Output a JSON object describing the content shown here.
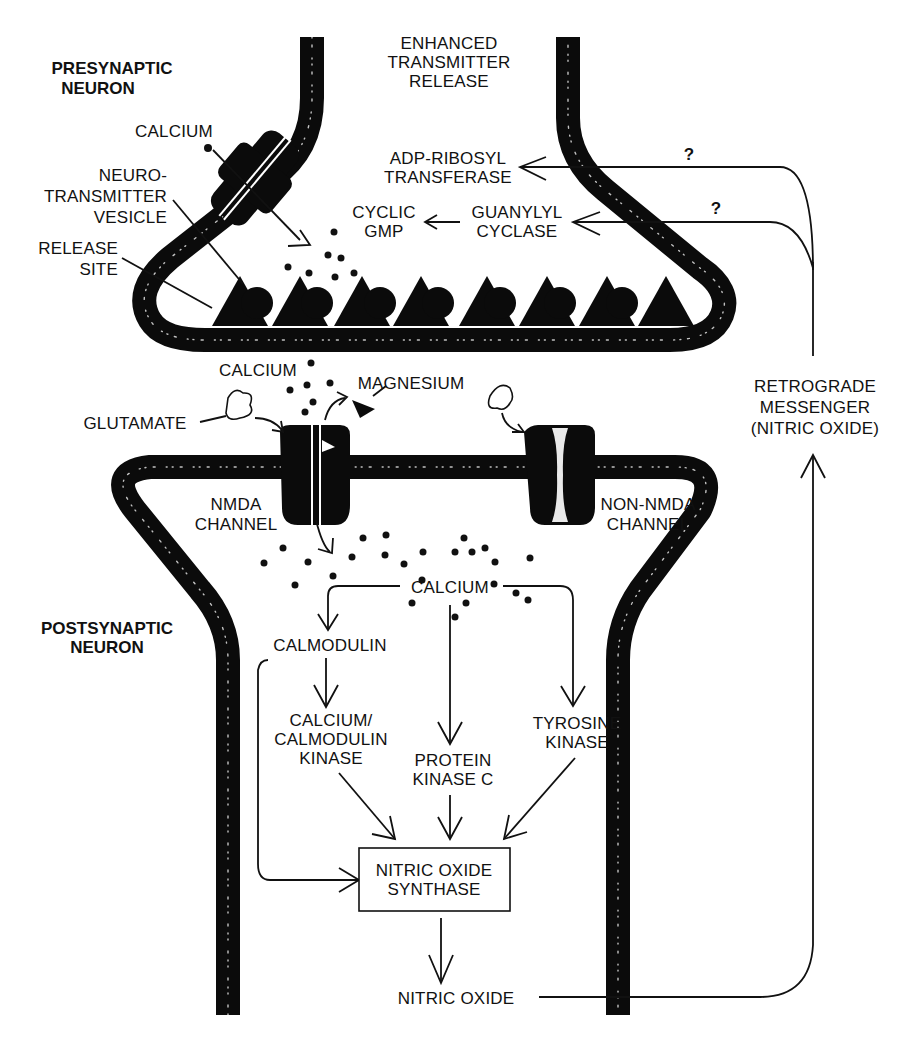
{
  "figure": {
    "regions": {
      "presynaptic": {
        "line1": "PRESYNAPTIC",
        "line2": "NEURON"
      },
      "postsynaptic": {
        "line1": "POSTSYNAPTIC",
        "line2": "NEURON"
      }
    },
    "presynaptic_labels": {
      "enhanced_release": {
        "line1": "ENHANCED",
        "line2": "TRANSMITTER",
        "line3": "RELEASE"
      },
      "calcium": "CALCIUM",
      "vesicle": {
        "line1": "NEURO-",
        "line2": "TRANSMITTER",
        "line3": "VESICLE"
      },
      "release_site": {
        "line1": "RELEASE",
        "line2": "SITE"
      },
      "adp_ribosyl": {
        "line1": "ADP-RIBOSYL",
        "line2": "TRANSFERASE"
      },
      "cyclic_gmp": {
        "line1": "CYCLIC",
        "line2": "GMP"
      },
      "guanylyl": {
        "line1": "GUANYLYL",
        "line2": "CYCLASE"
      },
      "question_mark_1": "?",
      "question_mark_2": "?"
    },
    "cleft_labels": {
      "calcium": "CALCIUM",
      "magnesium": "MAGNESIUM",
      "glutamate": "GLUTAMATE",
      "retrograde": {
        "line1": "RETROGRADE",
        "line2": "MESSENGER",
        "line3": "(NITRIC OXIDE)"
      }
    },
    "channels": {
      "nmda": {
        "line1": "NMDA",
        "line2": "CHANNEL"
      },
      "non_nmda": {
        "line1": "NON-NMDA",
        "line2": "CHANNEL"
      }
    },
    "pathway": {
      "calcium": "CALCIUM",
      "calmodulin": "CALMODULIN",
      "camk": {
        "line1": "CALCIUM/",
        "line2": "CALMODULIN",
        "line3": "KINASE"
      },
      "pkc": {
        "line1": "PROTEIN",
        "line2": "KINASE C"
      },
      "tyrosine": {
        "line1": "TYROSINE",
        "line2": "KINASE"
      },
      "nos": {
        "line1": "NITRIC OXIDE",
        "line2": "SYNTHASE"
      },
      "nitric_oxide": "NITRIC OXIDE"
    },
    "vesicle_count": 7,
    "release_site_count": 8,
    "colors": {
      "ink": "#111111",
      "membrane": "#0b0b0b",
      "background": "#ffffff"
    }
  }
}
